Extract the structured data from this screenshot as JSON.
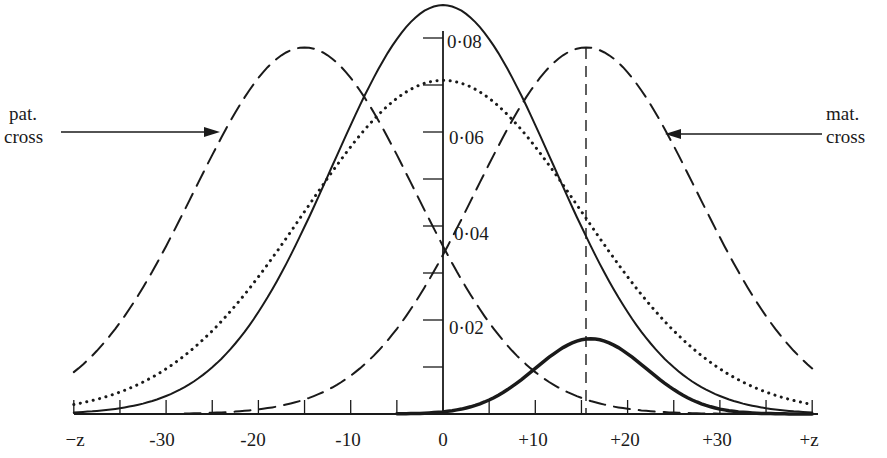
{
  "chart_data": {
    "type": "line",
    "title": "",
    "xlabel": "",
    "ylabel": "",
    "x_ticks": [
      {
        "value": -40,
        "label": "−z"
      },
      {
        "value": -30,
        "label": "-30"
      },
      {
        "value": -20,
        "label": "-20"
      },
      {
        "value": -10,
        "label": "-10"
      },
      {
        "value": 0,
        "label": "0"
      },
      {
        "value": 10,
        "label": "+10"
      },
      {
        "value": 20,
        "label": "+20"
      },
      {
        "value": 30,
        "label": "+30"
      },
      {
        "value": 40,
        "label": "+z"
      }
    ],
    "x_minor_ticks": [
      -35,
      -25,
      -15,
      -5,
      5,
      15,
      25,
      35
    ],
    "y_ticks": [
      {
        "value": 0.02,
        "label": "0·02"
      },
      {
        "value": 0.04,
        "label": "0·04"
      },
      {
        "value": 0.06,
        "label": "0·06"
      },
      {
        "value": 0.08,
        "label": "0·08"
      }
    ],
    "y_minor_ticks": [
      0.01,
      0.03,
      0.05,
      0.07
    ],
    "xlim": [
      -40,
      40
    ],
    "ylim": [
      0,
      0.088
    ],
    "grid": false,
    "legend": null,
    "series": [
      {
        "name": "solid (thin)",
        "style": "solid",
        "width": 2,
        "peak_x": 0,
        "peak_y": 0.087,
        "sd": 12,
        "x": [
          -40,
          -30,
          -20,
          -10,
          0,
          10,
          20,
          30,
          40
        ],
        "values": [
          0.0003,
          0.006,
          0.022,
          0.061,
          0.087,
          0.061,
          0.022,
          0.006,
          0.0003
        ]
      },
      {
        "name": "dotted",
        "style": "dotted",
        "width": 3,
        "peak_x": 0,
        "peak_y": 0.071,
        "sd": 15,
        "x": [
          -40,
          -30,
          -20,
          -10,
          0,
          10,
          20,
          30,
          40
        ],
        "values": [
          0.002,
          0.01,
          0.029,
          0.057,
          0.071,
          0.057,
          0.029,
          0.01,
          0.002
        ]
      },
      {
        "name": "pat. cross (dashed)",
        "style": "dashed",
        "width": 2,
        "peak_x": -15,
        "peak_y": 0.078,
        "sd": 12,
        "x": [
          -40,
          -30,
          -20,
          -15,
          -10,
          0,
          10,
          20,
          30,
          40
        ],
        "values": [
          0.014,
          0.036,
          0.07,
          0.078,
          0.07,
          0.036,
          0.012,
          0.003,
          0.0005,
          0.0001
        ]
      },
      {
        "name": "mat. cross (dashed)",
        "style": "dashed",
        "width": 2,
        "peak_x": 15.5,
        "peak_y": 0.078,
        "sd": 12,
        "x": [
          -40,
          -30,
          -20,
          -10,
          0,
          10,
          15.5,
          20,
          30,
          40
        ],
        "values": [
          0.0001,
          0.0004,
          0.002,
          0.011,
          0.034,
          0.069,
          0.078,
          0.071,
          0.037,
          0.012
        ]
      },
      {
        "name": "product (thick solid)",
        "style": "solid",
        "width": 3.5,
        "peak_x": 16,
        "peak_y": 0.016,
        "sd": 6,
        "x": [
          -5,
          0,
          5,
          10,
          16,
          20,
          25,
          30,
          40
        ],
        "values": [
          0.0,
          0.0004,
          0.003,
          0.01,
          0.016,
          0.013,
          0.005,
          0.0013,
          0.0
        ]
      }
    ],
    "annotations": [
      {
        "text": "pat.\ncross",
        "points_to": "left dashed curve",
        "arrow": "right"
      },
      {
        "text": "mat.\ncross",
        "points_to": "right dashed curve",
        "arrow": "left"
      },
      {
        "type": "dashed-vertical-line",
        "x": 15.5
      }
    ]
  },
  "labels": {
    "pat_line1": "pat.",
    "pat_line2": "cross",
    "mat_line1": "mat.",
    "mat_line2": "cross",
    "y_0_02": "0·02",
    "y_0_04": "0·04",
    "y_0_06": "0·06",
    "y_0_08": "0·08",
    "x_mz": "−z",
    "x_m30": "-30",
    "x_m20": "-20",
    "x_m10": "-10",
    "x_0": "0",
    "x_p10": "+10",
    "x_p20": "+20",
    "x_p30": "+30",
    "x_pz": "+z"
  }
}
